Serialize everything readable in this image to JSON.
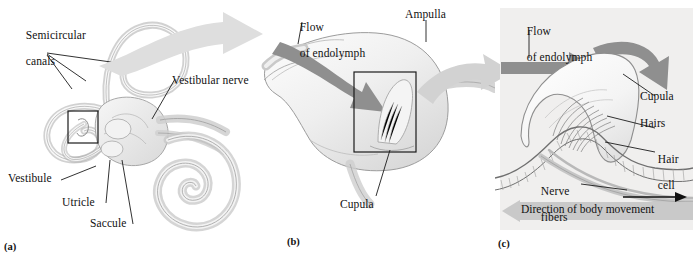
{
  "figure": {
    "type": "anatomical-diagram",
    "background_color": "#ffffff",
    "panel_c_background_color": "#f0efee",
    "ink_color": "#111111",
    "flow_arrow_color": "#8f8f8f",
    "transition_arrow_color": "#d8d8d8",
    "movement_band_color": "#c9c9c9"
  },
  "panels": {
    "a": {
      "tag": "(a)",
      "labels": {
        "semicircular_canals_line1": "Semicircular",
        "semicircular_canals_line2": "canals",
        "vestibular_nerve": "Vestibular nerve",
        "vestibule": "Vestibule",
        "utricle": "Utricle",
        "saccule": "Saccule"
      }
    },
    "b": {
      "tag": "(b)",
      "labels": {
        "flow_line1": "Flow",
        "flow_line2": "of endolymph",
        "ampulla": "Ampulla",
        "cupula": "Cupula"
      }
    },
    "c": {
      "tag": "(c)",
      "labels": {
        "flow_line1": "Flow",
        "flow_line2": "of endolymph",
        "cupula": "Cupula",
        "hairs": "Hairs",
        "hair_cell_line1": "Hair",
        "hair_cell_line2": "cell",
        "nerve_fibers_line1": "Nerve",
        "nerve_fibers_line2": "fibers",
        "direction_of_body_movement": "Direction of body movement"
      }
    }
  }
}
